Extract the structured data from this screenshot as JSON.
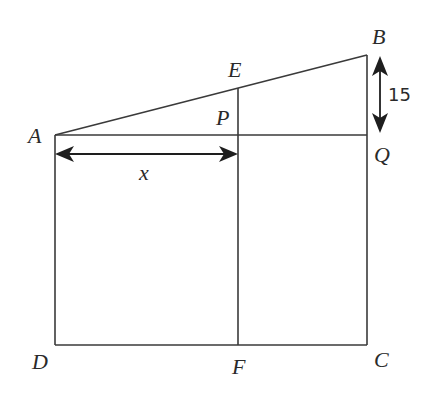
{
  "diagram": {
    "type": "geometry",
    "points": {
      "A": {
        "label": "A",
        "x": 55,
        "y": 135
      },
      "B": {
        "label": "B",
        "x": 367,
        "y": 55
      },
      "C": {
        "label": "C",
        "x": 367,
        "y": 345
      },
      "D": {
        "label": "D",
        "x": 55,
        "y": 345
      },
      "E": {
        "label": "E",
        "x": 238,
        "y": 88
      },
      "F": {
        "label": "F",
        "x": 238,
        "y": 345
      },
      "P": {
        "label": "P",
        "x": 238,
        "y": 135
      },
      "Q": {
        "label": "Q",
        "x": 367,
        "y": 135
      }
    },
    "segments": [
      "AB",
      "AQ",
      "BQ",
      "QC",
      "AD",
      "DC",
      "EF"
    ],
    "dimensions": {
      "x_label": "x",
      "x_spans": "A to P",
      "bq_label": "15",
      "bq_spans": "B to Q"
    }
  }
}
